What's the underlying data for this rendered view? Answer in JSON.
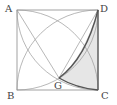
{
  "diagram": {
    "labels": {
      "A": "A",
      "B": "B",
      "C": "C",
      "D": "D",
      "G": "G"
    },
    "colors": {
      "line": "#8a8a8a",
      "thick": "#555555",
      "shade": "#e6e6e6"
    }
  }
}
